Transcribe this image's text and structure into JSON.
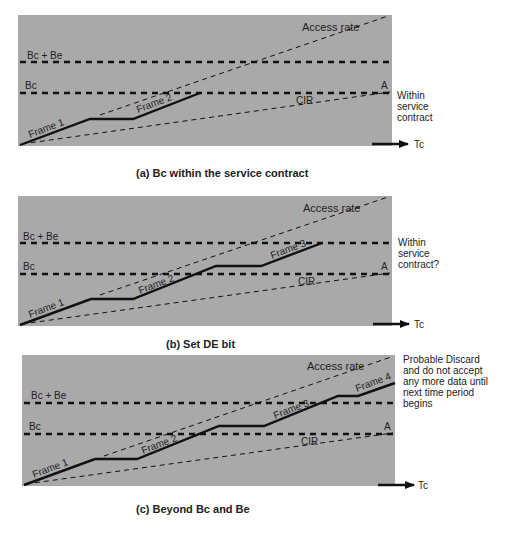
{
  "colors": {
    "panel_fill": "#a9a9a9",
    "line": "#111111",
    "text": "#222222"
  },
  "labels": {
    "bc_be": "Bc + Be",
    "bc": "Bc",
    "access_rate": "Access rate",
    "cir": "CIR",
    "point_a": "A",
    "time_axis": "Tc",
    "frame1": "Frame 1",
    "frame2": "Frame 2",
    "frame3": "Frame 3",
    "frame4": "Frame 4"
  },
  "panels": [
    {
      "id": "a",
      "caption": "(a)  Bc within the service contract",
      "note": [
        "Within",
        "service",
        "contract"
      ]
    },
    {
      "id": "b",
      "caption": "(b)  Set DE bit",
      "note": [
        "Within",
        "service",
        "contract?"
      ]
    },
    {
      "id": "c",
      "caption": "(c)  Beyond Bc and Be",
      "note": [
        "Probable Discard",
        "and do not accept",
        "any more data until",
        "next time period",
        "begins"
      ]
    }
  ]
}
